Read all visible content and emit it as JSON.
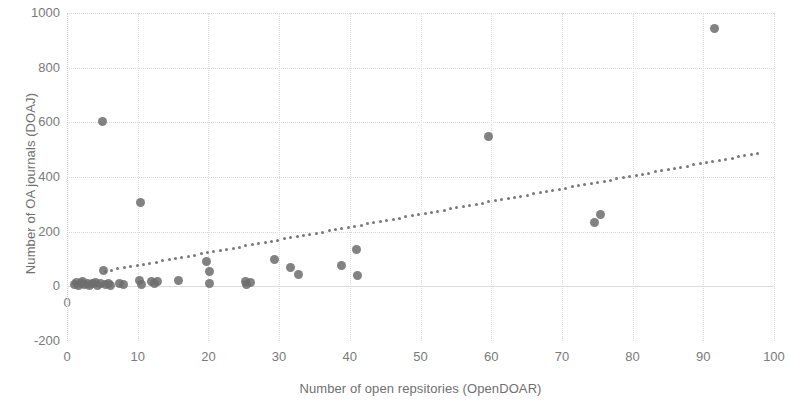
{
  "chart_data": {
    "type": "scatter",
    "title": "",
    "xlabel": "Number of open repsitories  (OpenDOAR)",
    "ylabel": "Number of OA journals  (DOAJ)",
    "xlim": [
      0,
      100
    ],
    "ylim": [
      -200,
      1000
    ],
    "xticks": [
      0,
      10,
      20,
      30,
      40,
      50,
      60,
      70,
      80,
      90,
      100
    ],
    "yticks": [
      -200,
      0,
      200,
      400,
      600,
      800,
      1000
    ],
    "grid": true,
    "legend": null,
    "marker_color": "#6e6e6e",
    "trendline_color": "#787878",
    "points": [
      {
        "x": 1.0,
        "y": 6
      },
      {
        "x": 1.3,
        "y": 14
      },
      {
        "x": 1.6,
        "y": 4
      },
      {
        "x": 2.0,
        "y": 10
      },
      {
        "x": 2.2,
        "y": 18
      },
      {
        "x": 2.5,
        "y": 5
      },
      {
        "x": 2.9,
        "y": 12
      },
      {
        "x": 3.2,
        "y": 3
      },
      {
        "x": 3.6,
        "y": 9
      },
      {
        "x": 4.0,
        "y": 14
      },
      {
        "x": 4.3,
        "y": 4
      },
      {
        "x": 4.7,
        "y": 10
      },
      {
        "x": 5.0,
        "y": 603
      },
      {
        "x": 5.1,
        "y": 58
      },
      {
        "x": 5.4,
        "y": 7
      },
      {
        "x": 5.8,
        "y": 12
      },
      {
        "x": 6.2,
        "y": 3
      },
      {
        "x": 7.4,
        "y": 9
      },
      {
        "x": 8.0,
        "y": 5
      },
      {
        "x": 10.4,
        "y": 305
      },
      {
        "x": 10.2,
        "y": 22
      },
      {
        "x": 10.6,
        "y": 8
      },
      {
        "x": 12.0,
        "y": 16
      },
      {
        "x": 12.4,
        "y": 10
      },
      {
        "x": 12.8,
        "y": 18
      },
      {
        "x": 15.8,
        "y": 20
      },
      {
        "x": 19.8,
        "y": 90
      },
      {
        "x": 20.1,
        "y": 55
      },
      {
        "x": 20.2,
        "y": 10
      },
      {
        "x": 25.3,
        "y": 18
      },
      {
        "x": 25.4,
        "y": 5
      },
      {
        "x": 26.0,
        "y": 14
      },
      {
        "x": 29.4,
        "y": 100
      },
      {
        "x": 31.6,
        "y": 70
      },
      {
        "x": 32.7,
        "y": 42
      },
      {
        "x": 38.8,
        "y": 78
      },
      {
        "x": 40.9,
        "y": 135
      },
      {
        "x": 41.1,
        "y": 38
      },
      {
        "x": 59.6,
        "y": 547
      },
      {
        "x": 74.6,
        "y": 235
      },
      {
        "x": 75.4,
        "y": 262
      },
      {
        "x": 91.6,
        "y": 945
      }
    ],
    "trendline": {
      "style": "dotted",
      "x_start": 5.4,
      "y_start": 55,
      "x_end": 98.5,
      "y_end": 490
    }
  }
}
